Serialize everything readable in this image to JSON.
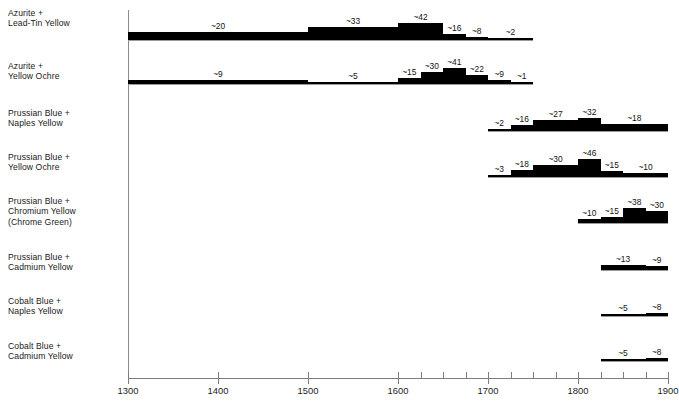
{
  "chart_data": {
    "type": "bar",
    "title": "",
    "subtitle": "",
    "xlabel": "",
    "ylabel": "",
    "xlim": [
      1300,
      1900
    ],
    "xtick_labels": [
      "1300",
      "1400",
      "1500",
      "1600",
      "1700",
      "1800",
      "1900"
    ],
    "xticks_major": [
      1300,
      1400,
      1500,
      1600,
      1700,
      1800,
      1900
    ],
    "xticks_minor": [
      1625,
      1650,
      1675,
      1725,
      1750,
      1775,
      1825,
      1850,
      1875
    ],
    "grid": false,
    "legend": "none",
    "note": "Stepped histogram-style timeline: for each pigment mixture, black blocks give approximate occurrence counts per time period along the 1300-1900 year axis.",
    "categories": [
      "Azurite + Lead-Tin Yellow",
      "Azurite + Yellow Ochre",
      "Prussian Blue + Naples Yellow",
      "Prussian Blue + Yellow Ochre",
      "Prussian Blue + Chromium Yellow (Chrome Green)",
      "Prussian Blue + Cadmium Yellow",
      "Cobalt Blue + Naples Yellow",
      "Cobalt Blue + Cadmium Yellow"
    ],
    "series": [
      {
        "name": "Azurite + Lead-Tin Yellow",
        "segments": [
          {
            "start": 1300,
            "end": 1500,
            "value": 20,
            "label": "~20"
          },
          {
            "start": 1500,
            "end": 1600,
            "value": 33,
            "label": "~33"
          },
          {
            "start": 1600,
            "end": 1650,
            "value": 42,
            "label": "~42"
          },
          {
            "start": 1650,
            "end": 1675,
            "value": 16,
            "label": "~16"
          },
          {
            "start": 1675,
            "end": 1700,
            "value": 8,
            "label": "~8"
          },
          {
            "start": 1700,
            "end": 1750,
            "value": 2,
            "label": "~2"
          }
        ]
      },
      {
        "name": "Azurite + Yellow Ochre",
        "segments": [
          {
            "start": 1300,
            "end": 1500,
            "value": 9,
            "label": "~9"
          },
          {
            "start": 1500,
            "end": 1600,
            "value": 5,
            "label": "~5"
          },
          {
            "start": 1600,
            "end": 1625,
            "value": 15,
            "label": "~15"
          },
          {
            "start": 1625,
            "end": 1650,
            "value": 30,
            "label": "~30"
          },
          {
            "start": 1650,
            "end": 1675,
            "value": 41,
            "label": "~41"
          },
          {
            "start": 1675,
            "end": 1700,
            "value": 22,
            "label": "~22"
          },
          {
            "start": 1700,
            "end": 1725,
            "value": 9,
            "label": "~9"
          },
          {
            "start": 1725,
            "end": 1750,
            "value": 1,
            "label": "~1"
          }
        ]
      },
      {
        "name": "Prussian Blue + Naples Yellow",
        "segments": [
          {
            "start": 1700,
            "end": 1725,
            "value": 2,
            "label": "~2"
          },
          {
            "start": 1725,
            "end": 1750,
            "value": 16,
            "label": "~16"
          },
          {
            "start": 1750,
            "end": 1800,
            "value": 27,
            "label": "~27"
          },
          {
            "start": 1800,
            "end": 1825,
            "value": 32,
            "label": "~32"
          },
          {
            "start": 1825,
            "end": 1900,
            "value": 18,
            "label": "~18"
          }
        ]
      },
      {
        "name": "Prussian Blue + Yellow Ochre",
        "segments": [
          {
            "start": 1700,
            "end": 1725,
            "value": 3,
            "label": "~3"
          },
          {
            "start": 1725,
            "end": 1750,
            "value": 18,
            "label": "~18"
          },
          {
            "start": 1750,
            "end": 1800,
            "value": 30,
            "label": "~30"
          },
          {
            "start": 1800,
            "end": 1825,
            "value": 46,
            "label": "~46"
          },
          {
            "start": 1825,
            "end": 1850,
            "value": 15,
            "label": "~15"
          },
          {
            "start": 1850,
            "end": 1900,
            "value": 10,
            "label": "~10"
          }
        ]
      },
      {
        "name": "Prussian Blue + Chromium Yellow (Chrome Green)",
        "segments": [
          {
            "start": 1800,
            "end": 1825,
            "value": 10,
            "label": "~10"
          },
          {
            "start": 1825,
            "end": 1850,
            "value": 15,
            "label": "~15"
          },
          {
            "start": 1850,
            "end": 1875,
            "value": 38,
            "label": "~38"
          },
          {
            "start": 1875,
            "end": 1900,
            "value": 30,
            "label": "~30"
          }
        ]
      },
      {
        "name": "Prussian Blue + Cadmium Yellow",
        "segments": [
          {
            "start": 1825,
            "end": 1875,
            "value": 13,
            "label": "~13"
          },
          {
            "start": 1875,
            "end": 1900,
            "value": 9,
            "label": "~9"
          }
        ]
      },
      {
        "name": "Cobalt Blue + Naples Yellow",
        "segments": [
          {
            "start": 1825,
            "end": 1875,
            "value": 5,
            "label": "~5"
          },
          {
            "start": 1875,
            "end": 1900,
            "value": 8,
            "label": "~8"
          }
        ]
      },
      {
        "name": "Cobalt Blue + Cadmium Yellow",
        "segments": [
          {
            "start": 1825,
            "end": 1875,
            "value": 5,
            "label": "~5"
          },
          {
            "start": 1875,
            "end": 1900,
            "value": 8,
            "label": "~8"
          }
        ]
      }
    ]
  },
  "rows": [
    {
      "label": "Azurite +\nLead-Tin Yellow"
    },
    {
      "label": "Azurite +\nYellow Ochre"
    },
    {
      "label": "Prussian Blue +\nNaples Yellow"
    },
    {
      "label": "Prussian Blue +\nYellow Ochre"
    },
    {
      "label": "Prussian Blue +\nChromium Yellow\n(Chrome Green)"
    },
    {
      "label": "Prussian Blue +\nCadmium Yellow"
    },
    {
      "label": "Cobalt Blue +\nNaples Yellow"
    },
    {
      "label": "Cobalt Blue +\nCadmium Yellow"
    }
  ],
  "axis": {
    "labels": [
      "1300",
      "1400",
      "1500",
      "1600",
      "1700",
      "1800",
      "1900"
    ]
  },
  "colors": {
    "bar": "#000000",
    "axis": "#7d7d7d",
    "baseline": "#9a9a9a",
    "text": "#1a1a1a",
    "background": "#ffffff"
  }
}
